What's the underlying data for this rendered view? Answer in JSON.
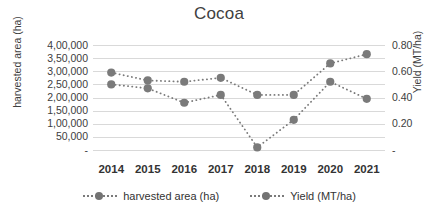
{
  "chart_data": {
    "type": "line",
    "title": "Cocoa",
    "xlabel": "",
    "ylabel": "harvested area (ha)",
    "ylabel_secondary": "Yield (MT/ha)",
    "categories": [
      "2014",
      "2015",
      "2016",
      "2017",
      "2018",
      "2019",
      "2020",
      "2021"
    ],
    "series": [
      {
        "name": "harvested area (ha)",
        "axis": "left",
        "values": [
          250000,
          235000,
          180000,
          210000,
          10000,
          115000,
          260000,
          195000
        ],
        "color": "#7a7a7a",
        "marker": "circle",
        "linestyle": "dotted"
      },
      {
        "name": "Yield (MT/ha)",
        "axis": "right",
        "values": [
          0.59,
          0.53,
          0.52,
          0.55,
          0.42,
          0.42,
          0.66,
          0.73
        ],
        "color": "#7a7a7a",
        "marker": "circle",
        "linestyle": "dotted"
      }
    ],
    "ylim": [
      0,
      400000
    ],
    "ylim_secondary": [
      0,
      0.8
    ],
    "yticks_left": [
      "4,00,000",
      "3,50,000",
      "3,00,000",
      "2,50,000",
      "2,00,000",
      "1,50,000",
      "1,00,000",
      "50,000",
      "-"
    ],
    "yticks_left_values": [
      400000,
      350000,
      300000,
      250000,
      200000,
      150000,
      100000,
      50000,
      0
    ],
    "yticks_right": [
      "0.80",
      "0.60",
      "0.40",
      "0.20",
      "-"
    ],
    "yticks_right_values": [
      0.8,
      0.6,
      0.4,
      0.2,
      0
    ],
    "grid": true,
    "legend_position": "bottom"
  },
  "legend": {
    "items": [
      {
        "label": "harvested area (ha)"
      },
      {
        "label": "Yield (MT/ha)"
      }
    ]
  }
}
